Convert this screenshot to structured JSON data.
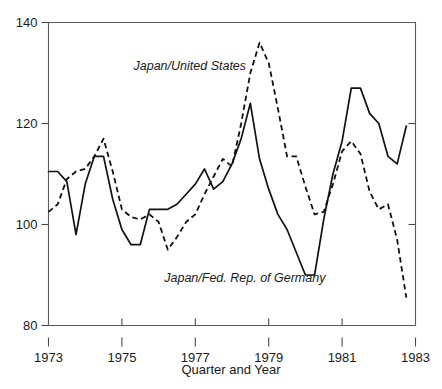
{
  "figure": {
    "background_color": "#ffffff",
    "ink_color": "#111111",
    "frame_color": "#5b5b5b"
  },
  "chart_data": {
    "type": "line",
    "title": "",
    "subtitle": "",
    "xlabel": "Quarter and Year",
    "ylabel": "",
    "xlim": [
      1973.0,
      1983.0
    ],
    "ylim": [
      80,
      140
    ],
    "grid": false,
    "legend_position": "inline-annotation",
    "x_tick_labels": [
      "1973",
      "1975",
      "1977",
      "1979",
      "1981",
      "1983"
    ],
    "x_tick_values": [
      1973,
      1975,
      1977,
      1979,
      1981,
      1983
    ],
    "y_tick_labels": [
      "80",
      "100",
      "120",
      "140"
    ],
    "y_tick_values": [
      80,
      100,
      120,
      140
    ],
    "x_minor_tick_note": "quarterly observations",
    "annotations": [
      {
        "text": "Japan/United States",
        "series": "Japan/United States",
        "x": 1976.85,
        "y": 130.5,
        "style": "italic"
      },
      {
        "text": "Japan/Fed. Rep. of Germany",
        "series": "Japan/Fed. Rep. of Germany",
        "x": 1978.35,
        "y": 88.6,
        "style": "italic"
      }
    ],
    "series": [
      {
        "name": "Japan/United States",
        "line_style": "dashed",
        "color": "#111111",
        "x": [
          1973.0,
          1973.25,
          1973.5,
          1973.75,
          1974.0,
          1974.25,
          1974.5,
          1974.75,
          1975.0,
          1975.25,
          1975.5,
          1975.75,
          1976.0,
          1976.25,
          1976.5,
          1976.75,
          1977.0,
          1977.25,
          1977.5,
          1977.75,
          1978.0,
          1978.25,
          1978.5,
          1978.75,
          1979.0,
          1979.25,
          1979.5,
          1979.75,
          1980.0,
          1980.25,
          1980.5,
          1980.75,
          1981.0,
          1981.25,
          1981.5,
          1981.75,
          1982.0,
          1982.25,
          1982.5,
          1982.75
        ],
        "values": [
          102.5,
          104.0,
          109.0,
          110.5,
          111.0,
          113.5,
          117.0,
          110.5,
          103.0,
          101.5,
          101.0,
          102.0,
          100.5,
          95.0,
          97.5,
          100.5,
          102.0,
          106.0,
          109.5,
          113.0,
          111.5,
          120.0,
          130.0,
          136.0,
          132.0,
          123.0,
          113.5,
          113.5,
          107.5,
          102.0,
          102.5,
          108.0,
          114.5,
          116.5,
          114.0,
          106.5,
          103.0,
          104.0,
          97.0,
          85.5
        ]
      },
      {
        "name": "Japan/Fed. Rep. of Germany",
        "line_style": "solid",
        "color": "#111111",
        "x": [
          1973.0,
          1973.25,
          1973.5,
          1973.75,
          1974.0,
          1974.25,
          1974.5,
          1974.75,
          1975.0,
          1975.25,
          1975.5,
          1975.75,
          1976.0,
          1976.25,
          1976.5,
          1976.75,
          1977.0,
          1977.25,
          1977.5,
          1977.75,
          1978.0,
          1978.25,
          1978.5,
          1978.75,
          1979.0,
          1979.25,
          1979.5,
          1979.75,
          1980.0,
          1980.25,
          1980.5,
          1980.75,
          1981.0,
          1981.25,
          1981.5,
          1981.75,
          1982.0,
          1982.25,
          1982.5,
          1982.75
        ],
        "values": [
          110.5,
          110.5,
          108.5,
          98.0,
          108.0,
          113.5,
          113.5,
          105.0,
          99.0,
          96.0,
          96.0,
          103.0,
          103.0,
          103.0,
          104.0,
          106.0,
          108.0,
          111.0,
          107.0,
          108.5,
          112.0,
          117.0,
          124.0,
          113.0,
          107.0,
          102.0,
          99.0,
          94.5,
          90.0,
          90.0,
          101.0,
          110.0,
          116.5,
          127.0,
          127.0,
          122.0,
          120.0,
          113.5,
          112.0,
          119.5
        ]
      }
    ]
  }
}
